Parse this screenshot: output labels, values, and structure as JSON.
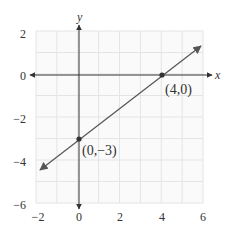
{
  "chart_data": {
    "type": "line",
    "title": "",
    "xlabel": "x",
    "ylabel": "y",
    "xlim": [
      -2,
      6
    ],
    "ylim": [
      -6,
      2
    ],
    "grid": true,
    "x_ticks": [
      "−2",
      "0",
      "2",
      "4",
      "6"
    ],
    "y_ticks": [
      "2",
      "0",
      "−2",
      "−4",
      "−6"
    ],
    "series": [
      {
        "name": "line",
        "equation": "y = 0.75x - 3",
        "x": [
          -2,
          6
        ],
        "y": [
          -4.5,
          1.5
        ],
        "arrows": "both"
      }
    ],
    "points": [
      {
        "x": 4,
        "y": 0,
        "label": "(4,0)"
      },
      {
        "x": 0,
        "y": -3,
        "label": "(0,−3)"
      }
    ],
    "colors": {
      "grid": "#e4e4e4",
      "axis": "#333333",
      "line": "#555555",
      "point": "#333333"
    }
  }
}
